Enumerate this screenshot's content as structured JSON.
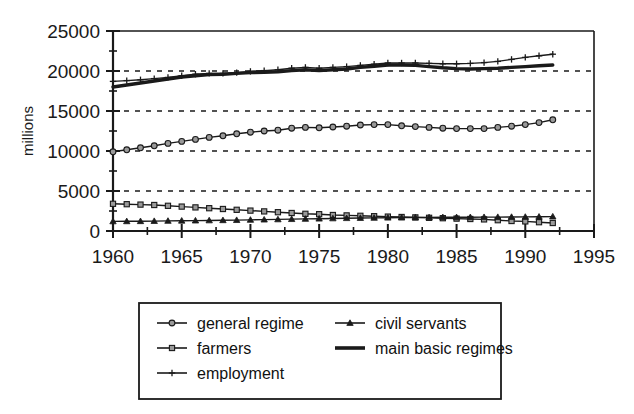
{
  "chart_data": {
    "type": "line",
    "title": "",
    "subtitle": "",
    "xlabel": "",
    "ylabel": "millions",
    "xlim": [
      1960,
      1995
    ],
    "ylim": [
      0,
      25000
    ],
    "xticks": [
      1960,
      1965,
      1970,
      1975,
      1980,
      1985,
      1990,
      1995
    ],
    "xtick_labels": [
      "1960",
      "1965",
      "1970",
      "1975",
      "1980",
      "1985",
      "1990",
      "1995"
    ],
    "yticks": [
      0,
      5000,
      10000,
      15000,
      20000,
      25000
    ],
    "ytick_labels": [
      "0",
      "5000",
      "10000",
      "15000",
      "20000",
      "25000"
    ],
    "y_minor_ticks": [
      2500,
      7500,
      12500,
      17500,
      22500
    ],
    "grid": "horizontal-dashed",
    "legend_position": "bottom",
    "x": [
      1960,
      1961,
      1962,
      1963,
      1964,
      1965,
      1966,
      1967,
      1968,
      1969,
      1970,
      1971,
      1972,
      1973,
      1974,
      1975,
      1976,
      1977,
      1978,
      1979,
      1980,
      1981,
      1982,
      1983,
      1984,
      1985,
      1986,
      1987,
      1988,
      1989,
      1990,
      1991,
      1992
    ],
    "series": [
      {
        "name": "general regime",
        "marker": "circle",
        "line_width": 1.4,
        "values": [
          9900,
          10150,
          10400,
          10650,
          10950,
          11200,
          11450,
          11700,
          11900,
          12150,
          12350,
          12500,
          12600,
          12850,
          12950,
          12900,
          13000,
          13100,
          13250,
          13300,
          13300,
          13150,
          13050,
          12950,
          12850,
          12800,
          12800,
          12800,
          12950,
          13100,
          13300,
          13550,
          13900
        ]
      },
      {
        "name": "farmers",
        "marker": "square",
        "line_width": 1.4,
        "values": [
          3400,
          3350,
          3300,
          3250,
          3150,
          3050,
          2950,
          2850,
          2750,
          2650,
          2550,
          2450,
          2350,
          2250,
          2150,
          2100,
          2000,
          1950,
          1900,
          1850,
          1800,
          1750,
          1700,
          1650,
          1600,
          1550,
          1500,
          1450,
          1350,
          1250,
          1200,
          1100,
          1000
        ]
      },
      {
        "name": "employment",
        "marker": "cross",
        "line_width": 1.4,
        "values": [
          18700,
          18800,
          18900,
          19050,
          19200,
          19400,
          19600,
          19700,
          19700,
          19800,
          19950,
          20050,
          20150,
          20350,
          20450,
          20350,
          20450,
          20550,
          20700,
          20850,
          21000,
          21000,
          21000,
          20950,
          20900,
          20900,
          20950,
          21050,
          21200,
          21450,
          21700,
          21900,
          22100
        ]
      },
      {
        "name": "civil servants",
        "marker": "triangle",
        "line_width": 1.4,
        "values": [
          1200,
          1210,
          1220,
          1240,
          1260,
          1280,
          1300,
          1320,
          1340,
          1360,
          1390,
          1420,
          1450,
          1480,
          1510,
          1540,
          1570,
          1600,
          1620,
          1640,
          1660,
          1680,
          1690,
          1700,
          1710,
          1710,
          1720,
          1730,
          1740,
          1750,
          1760,
          1780,
          1800
        ]
      },
      {
        "name": "main basic regimes",
        "marker": "none",
        "line_width": 3.4,
        "values": [
          18000,
          18250,
          18500,
          18750,
          19000,
          19250,
          19400,
          19550,
          19600,
          19700,
          19800,
          19850,
          19900,
          20050,
          20150,
          20050,
          20150,
          20250,
          20450,
          20600,
          20750,
          20750,
          20700,
          20550,
          20400,
          20300,
          20250,
          20300,
          20350,
          20450,
          20550,
          20650,
          20750
        ]
      }
    ]
  },
  "legend": {
    "entries": [
      {
        "label": "general regime",
        "marker": "circle",
        "column": 1
      },
      {
        "label": "farmers",
        "marker": "square",
        "column": 1
      },
      {
        "label": "employment",
        "marker": "cross",
        "column": 1
      },
      {
        "label": "civil servants",
        "marker": "triangle",
        "column": 2
      },
      {
        "label": "main basic regimes",
        "marker": "thick-line",
        "column": 2
      }
    ]
  },
  "colors": {
    "line": "#1a1a1a",
    "grid": "#1a1a1a",
    "background": "#ffffff",
    "text": "#111111"
  }
}
